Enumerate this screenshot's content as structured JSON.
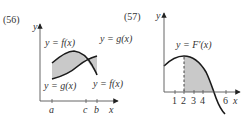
{
  "figures": [
    {
      "id": "56",
      "number_label": "(56)",
      "y_axis_label": "y",
      "x_axis_label": "x",
      "curve_labels": {
        "f_top": "y = f(x)",
        "g_top": "y = g(x)",
        "g_bottom": "y = g(x)",
        "f_bottom": "y = f(x)"
      },
      "ticks": [
        "a",
        "c",
        "b"
      ],
      "shading": "region between f(x) and g(x) from a to b",
      "shade_color": "#c9c9c9",
      "curve_color": "#1a1a1a"
    },
    {
      "id": "57",
      "number_label": "(57)",
      "y_axis_label": "y",
      "x_axis_label": "x",
      "curve_label": "y = F′(x)",
      "ticks": [
        "1",
        "2",
        "3",
        "4",
        "6"
      ],
      "dashed_line_at": "2",
      "shading": "region under F'(x) from x=2 to root between 4 and 6",
      "shade_color": "#c9c9c9",
      "curve_color": "#1a1a1a"
    }
  ]
}
